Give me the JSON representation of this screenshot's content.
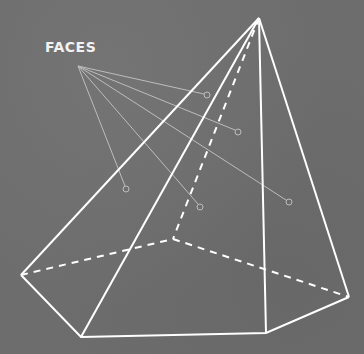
{
  "diagram": {
    "label": "FACES",
    "colors": {
      "background": "#6d6d6d",
      "edge": "#ffffff",
      "pointer": "#bdbdbd"
    },
    "shape": "pentagonal pyramid",
    "vertices": {
      "apex": [
        259,
        18
      ],
      "left": [
        21,
        275
      ],
      "back": [
        173,
        239
      ],
      "bottom_left": [
        81,
        337
      ],
      "bottom_right": [
        266,
        333
      ],
      "right": [
        349,
        297
      ]
    },
    "pointer_origin": [
      78,
      66
    ],
    "pointer_targets": [
      [
        207,
        95
      ],
      [
        238,
        132
      ],
      [
        126,
        189
      ],
      [
        200,
        207
      ],
      [
        289,
        202
      ]
    ]
  }
}
